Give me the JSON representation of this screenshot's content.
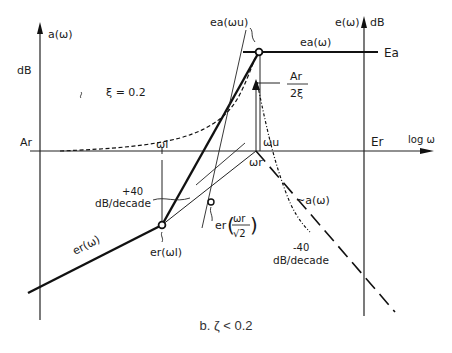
{
  "diagram": {
    "left_axis": {
      "label": "a(ω)",
      "unit": "dB"
    },
    "right_axis": {
      "label": "e(ω)",
      "unit": "dB"
    },
    "x_axis": {
      "label": "log ω"
    },
    "levels": {
      "Ar": "Ar",
      "Er": "Er",
      "Ea": "Ea"
    },
    "damping_note": "ξ = 0.2",
    "frequencies": {
      "omega_l": "ωl",
      "omega_u": "ωu",
      "omega_r": "ωr"
    },
    "labels": {
      "ea_omega_u": "ea(ωu)",
      "ea_omega": "ea(ω)",
      "peak_num": "Ar",
      "peak_den": "2ξ",
      "er_omega": "er(ω)",
      "er_omega_l": "er(ωl)",
      "er_prefix": "er",
      "er_frac_num": "ωr",
      "er_frac_den": "√2",
      "a_omega_approx": "~a(ω)",
      "slope_up_1": "+40",
      "slope_up_2": "dB/decade",
      "slope_down_1": "-40",
      "slope_down_2": "dB/decade"
    },
    "caption": "b. ζ < 0.2"
  }
}
